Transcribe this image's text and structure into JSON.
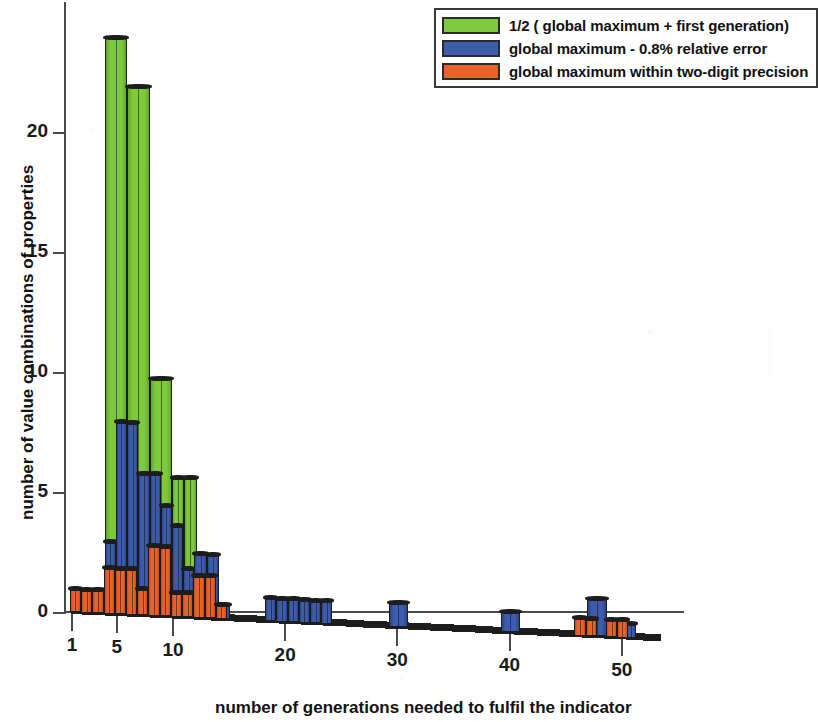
{
  "chart_data": {
    "type": "bar",
    "title": "",
    "subtitle": "",
    "xlabel": "number of generations needed to fulfil the indicator",
    "ylabel": "number of value combinations of properties",
    "xlim": [
      0,
      54
    ],
    "ylim": [
      0,
      24.5
    ],
    "grid": false,
    "legend_position": "top-right",
    "orientation": "overlapping-histogram-3d",
    "xticks": [
      1,
      5,
      10,
      20,
      30,
      40,
      50
    ],
    "xtick_labels": [
      "1",
      "5",
      "10",
      "20",
      "30",
      "40",
      "50"
    ],
    "yticks": [
      0,
      5,
      10,
      15,
      20
    ],
    "ytick_labels": [
      "0",
      "5",
      "10",
      "15",
      "20"
    ],
    "x": [
      1,
      2,
      3,
      4,
      5,
      6,
      7,
      8,
      9,
      10,
      11,
      12,
      13,
      14,
      15,
      16,
      17,
      18,
      19,
      20,
      21,
      22,
      23,
      24,
      25,
      26,
      27,
      28,
      29,
      30,
      31,
      40,
      41,
      42,
      46,
      47,
      48,
      49,
      50,
      51
    ],
    "series": [
      {
        "name": "1/2 ( global maximum + first generation)",
        "color": "#7FC93C",
        "values": [
          0,
          0,
          0,
          1,
          24,
          24,
          22,
          22,
          10,
          10,
          6,
          6,
          0,
          0,
          0,
          0,
          0,
          0,
          0,
          0,
          0,
          0,
          0,
          0,
          0,
          0,
          0,
          0,
          0,
          0,
          0,
          0,
          0,
          0,
          0,
          0,
          0,
          0,
          0,
          0
        ]
      },
      {
        "name": "global maximum - 0.8% relative error",
        "color": "#3D5CAD",
        "values": [
          0,
          0,
          0,
          0,
          3,
          3,
          8,
          8,
          6,
          6,
          5,
          5,
          4,
          4,
          2.7,
          2.7,
          0.6,
          0,
          1,
          1,
          1,
          1,
          1,
          1,
          0,
          0,
          0,
          0,
          0,
          1,
          0,
          1,
          0,
          0,
          1.6,
          1.6,
          0.6,
          0.6,
          0,
          0
        ]
      },
      {
        "name": "global maximum within two-digit precision",
        "color": "#E8622B",
        "values": [
          1,
          1,
          1,
          1.9,
          1.9,
          2.1,
          2.1,
          1.1,
          1.1,
          2.9,
          2.9,
          1.7,
          1.7,
          0.6,
          0,
          0,
          0,
          0,
          0,
          0,
          0,
          0,
          0,
          0,
          0,
          0,
          0,
          0,
          0,
          0,
          0,
          0,
          0,
          0,
          0.7,
          0.7,
          0.7,
          0.7,
          0,
          0
        ]
      }
    ]
  },
  "bars": {
    "green": [
      {
        "x0": 4.0,
        "x1": 6.0,
        "h": 24.0
      },
      {
        "x0": 6.0,
        "x1": 8.0,
        "h": 22.0
      },
      {
        "x0": 8.0,
        "x1": 10.0,
        "h": 9.9
      },
      {
        "x0": 10.0,
        "x1": 11.1,
        "h": 5.8
      },
      {
        "x0": 11.1,
        "x1": 12.2,
        "h": 5.8
      },
      {
        "x0": 3.0,
        "x1": 4.0,
        "h": 0.9
      }
    ],
    "blue": [
      {
        "x0": 4.0,
        "x1": 5.0,
        "h": 3.0
      },
      {
        "x0": 5.0,
        "x1": 6.0,
        "h": 8.0
      },
      {
        "x0": 6.0,
        "x1": 7.0,
        "h": 8.0
      },
      {
        "x0": 7.0,
        "x1": 8.0,
        "h": 5.9
      },
      {
        "x0": 8.0,
        "x1": 9.0,
        "h": 5.9
      },
      {
        "x0": 9.0,
        "x1": 10.0,
        "h": 4.6
      },
      {
        "x0": 10.0,
        "x1": 11.0,
        "h": 3.8
      },
      {
        "x0": 11.0,
        "x1": 12.0,
        "h": 2.0
      },
      {
        "x0": 12.0,
        "x1": 13.1,
        "h": 2.65
      },
      {
        "x0": 13.1,
        "x1": 14.2,
        "h": 2.65
      },
      {
        "x0": 14.2,
        "x1": 15.2,
        "h": 0.6
      },
      {
        "x0": 18.3,
        "x1": 19.3,
        "h": 0.95
      },
      {
        "x0": 19.3,
        "x1": 20.3,
        "h": 0.95
      },
      {
        "x0": 20.3,
        "x1": 21.3,
        "h": 0.95
      },
      {
        "x0": 21.3,
        "x1": 22.3,
        "h": 0.95
      },
      {
        "x0": 22.3,
        "x1": 23.3,
        "h": 0.95
      },
      {
        "x0": 23.3,
        "x1": 24.3,
        "h": 0.95
      },
      {
        "x0": 29.3,
        "x1": 31.0,
        "h": 1.0
      },
      {
        "x0": 39.3,
        "x1": 41.0,
        "h": 0.85
      },
      {
        "x0": 47.0,
        "x1": 48.8,
        "h": 1.55
      },
      {
        "x0": 50.4,
        "x1": 51.4,
        "h": 0.6
      }
    ],
    "orange": [
      {
        "x0": 0.9,
        "x1": 1.9,
        "h": 0.95
      },
      {
        "x0": 1.9,
        "x1": 2.9,
        "h": 0.95
      },
      {
        "x0": 2.9,
        "x1": 3.9,
        "h": 0.95
      },
      {
        "x0": 3.9,
        "x1": 4.9,
        "h": 1.9
      },
      {
        "x0": 4.9,
        "x1": 5.9,
        "h": 1.9
      },
      {
        "x0": 5.9,
        "x1": 6.9,
        "h": 1.9
      },
      {
        "x0": 6.9,
        "x1": 7.9,
        "h": 1.1
      },
      {
        "x0": 7.9,
        "x1": 8.9,
        "h": 2.9
      },
      {
        "x0": 8.9,
        "x1": 9.9,
        "h": 2.9
      },
      {
        "x0": 9.9,
        "x1": 10.9,
        "h": 1.0
      },
      {
        "x0": 10.9,
        "x1": 11.9,
        "h": 1.0
      },
      {
        "x0": 11.9,
        "x1": 12.9,
        "h": 1.75
      },
      {
        "x0": 12.9,
        "x1": 13.9,
        "h": 1.75
      },
      {
        "x0": 13.9,
        "x1": 14.9,
        "h": 0.6
      },
      {
        "x0": 45.8,
        "x1": 46.9,
        "h": 0.72
      },
      {
        "x0": 46.9,
        "x1": 47.9,
        "h": 0.72
      },
      {
        "x0": 48.7,
        "x1": 49.7,
        "h": 0.72
      },
      {
        "x0": 49.7,
        "x1": 50.6,
        "h": 0.72
      }
    ]
  },
  "legend": {
    "items": [
      {
        "label": "1/2 ( global maximum + first generation)",
        "color": "#7FC93C"
      },
      {
        "label": "global maximum - 0.8% relative error",
        "color": "#3D5CAD"
      },
      {
        "label": "global maximum within two-digit precision",
        "color": "#E8622B"
      }
    ]
  },
  "axes": {
    "x_title": "number of generations needed to fulfil the indicator",
    "y_title": "number of value combinations of properties",
    "x_ticks": [
      "1",
      "5",
      "10",
      "20",
      "30",
      "40",
      "50"
    ],
    "y_ticks": [
      "0",
      "5",
      "10",
      "15",
      "20"
    ]
  }
}
